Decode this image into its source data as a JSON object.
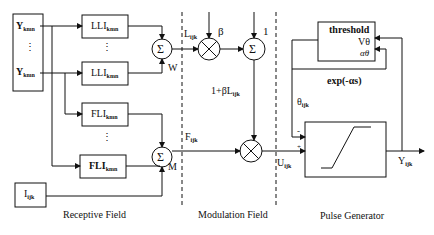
{
  "diagram": {
    "type": "PCNN neuron model block diagram",
    "sections": {
      "receptive": "Receptive Field",
      "modulation": "Modulation Field",
      "pulse": "Pulse Generator"
    },
    "inputs": {
      "y_top": {
        "base": "Y",
        "sub": "kmn"
      },
      "y_bottom": {
        "base": "Y",
        "sub": "kmn"
      },
      "vdots": "⋮",
      "stimulus": {
        "base": "I",
        "sub": "ijk"
      }
    },
    "blocks": {
      "lli_top": {
        "base": "LLI",
        "sub": "kmn"
      },
      "lli_bottom": {
        "base": "LLI",
        "sub": "kmn"
      },
      "fli_top": {
        "base": "FLI",
        "sub": "kmn"
      },
      "fli_bottom": {
        "base": "FLI",
        "sub": "kmn"
      },
      "vdots": "⋮",
      "threshold": {
        "title": "threshold",
        "v": "Vθ",
        "a": "αθ"
      }
    },
    "operators": {
      "sum": "Σ",
      "sum_w_label": "W",
      "sum_m_label": "M"
    },
    "signals": {
      "linking": {
        "base": "L",
        "sub": "ijk"
      },
      "feeding": {
        "base": "F",
        "sub": "ijk"
      },
      "beta": "β",
      "one": "1",
      "modulation": {
        "prefix": "1+βL",
        "sub": "ijk"
      },
      "internal": {
        "base": "U",
        "sub": "ijk"
      },
      "theta": {
        "base": "θ",
        "sub": "ijk"
      },
      "decay": "exp(-αs)",
      "output": {
        "base": "Y",
        "sub": "ijk"
      },
      "minus": "-",
      "plus": "+"
    }
  }
}
